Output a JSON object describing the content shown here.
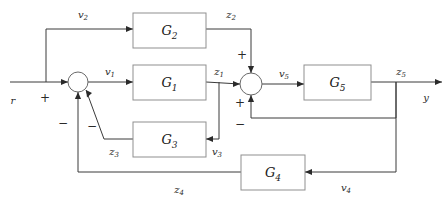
{
  "figure": {
    "type": "control-system-block-diagram",
    "title": "",
    "background_color": "#ffffff",
    "line_color": "#3a3a3a",
    "box_stroke_color": "#8f8f8f",
    "text_color": "#1a1a1a",
    "width": 447,
    "height": 205
  },
  "blocks": [
    {
      "id": "G2",
      "base": "G",
      "sub": "2",
      "x": 133,
      "y": 13,
      "w": 73,
      "h": 35
    },
    {
      "id": "G1",
      "base": "G",
      "sub": "1",
      "x": 133,
      "y": 65,
      "w": 73,
      "h": 35
    },
    {
      "id": "G3",
      "base": "G",
      "sub": "3",
      "x": 133,
      "y": 122,
      "w": 73,
      "h": 35
    },
    {
      "id": "G4",
      "base": "G",
      "sub": "4",
      "x": 241,
      "y": 155,
      "w": 64,
      "h": 35
    },
    {
      "id": "G5",
      "base": "G",
      "sub": "5",
      "x": 304,
      "y": 65,
      "w": 67,
      "h": 35
    }
  ],
  "summing_junctions": [
    {
      "id": "sum1",
      "cx": 78,
      "cy": 82,
      "r": 10,
      "signs": [
        {
          "label": "+",
          "port": "left",
          "x": 45,
          "y": 98
        },
        {
          "label": "−",
          "port": "bottom",
          "x": 63,
          "y": 123
        },
        {
          "label": "−",
          "port": "bottom-diagonal",
          "x": 92,
          "y": 126
        }
      ]
    },
    {
      "id": "sum2",
      "cx": 251,
      "cy": 84,
      "r": 11,
      "signs": [
        {
          "label": "+",
          "port": "top",
          "x": 242,
          "y": 55
        },
        {
          "label": "+",
          "port": "left",
          "x": 240,
          "y": 103
        },
        {
          "label": "−",
          "port": "bottom",
          "x": 240,
          "y": 124
        }
      ]
    }
  ],
  "signal_labels": [
    {
      "id": "r",
      "base": "r",
      "sub": "",
      "x": 13,
      "y": 101
    },
    {
      "id": "v2",
      "base": "v",
      "sub": "2",
      "x": 83,
      "y": 15
    },
    {
      "id": "z2",
      "base": "z",
      "sub": "2",
      "x": 231,
      "y": 15
    },
    {
      "id": "v1",
      "base": "v",
      "sub": "1",
      "x": 110,
      "y": 72
    },
    {
      "id": "z1",
      "base": "z",
      "sub": "1",
      "x": 219,
      "y": 72
    },
    {
      "id": "v5",
      "base": "v",
      "sub": "5",
      "x": 284,
      "y": 74
    },
    {
      "id": "z5",
      "base": "z",
      "sub": "5",
      "x": 401,
      "y": 72
    },
    {
      "id": "y",
      "base": "y",
      "sub": "",
      "x": 426,
      "y": 98
    },
    {
      "id": "z3",
      "base": "z",
      "sub": "3",
      "x": 114,
      "y": 152
    },
    {
      "id": "v3",
      "base": "v",
      "sub": "3",
      "x": 217,
      "y": 152
    },
    {
      "id": "z4",
      "base": "z",
      "sub": "4",
      "x": 179,
      "y": 190
    },
    {
      "id": "v4",
      "base": "v",
      "sub": "4",
      "x": 346,
      "y": 188
    }
  ],
  "wires": [
    {
      "id": "input-r-to-sum1",
      "d": "M 10 82 L 68 82"
    },
    {
      "id": "tap-to-G2-branch",
      "d": "M 46 82 L 46 29 L 133 29"
    },
    {
      "id": "G2-out-to-sum2",
      "d": "M 206 29 L 251 29 L 251 73"
    },
    {
      "id": "sum1-to-G1",
      "d": "M 88 82 L 133 82"
    },
    {
      "id": "G1-out-to-sum2",
      "d": "M 206 82 L 240 84"
    },
    {
      "id": "z1-tap-to-G3",
      "d": "M 219 82 L 219 139 L 206 139"
    },
    {
      "id": "G3-out-to-sum1",
      "d": "M 133 139 L 104 139 L 86 90"
    },
    {
      "id": "sum2-to-G5",
      "d": "M 262 84 L 304 84"
    },
    {
      "id": "G5-out-to-y",
      "d": "M 371 82 L 442 82"
    },
    {
      "id": "z5-tap-to-sum2-minus",
      "d": "M 396 82 L 396 118 L 251 118 L 251 95"
    },
    {
      "id": "z5-tap-to-G4",
      "d": "M 396 82 L 396 172 L 305 172"
    },
    {
      "id": "G4-out-to-sum1-minus",
      "d": "M 241 172 L 78 172 L 78 92"
    }
  ],
  "arrowheads": [
    {
      "id": "arrow-into-sum1-left",
      "x": 68,
      "y": 82,
      "dir": "right"
    },
    {
      "id": "arrow-into-G2",
      "x": 133,
      "y": 29,
      "dir": "right"
    },
    {
      "id": "arrow-into-G1",
      "x": 133,
      "y": 82,
      "dir": "right"
    },
    {
      "id": "arrow-into-sum2-left",
      "x": 240,
      "y": 84,
      "dir": "right"
    },
    {
      "id": "arrow-into-sum2-top",
      "x": 251,
      "y": 73,
      "dir": "down"
    },
    {
      "id": "arrow-into-sum2-bottom",
      "x": 251,
      "y": 95,
      "dir": "up"
    },
    {
      "id": "arrow-into-G5",
      "x": 304,
      "y": 84,
      "dir": "right"
    },
    {
      "id": "arrow-out-y",
      "x": 442,
      "y": 82,
      "dir": "right"
    },
    {
      "id": "arrow-into-G3",
      "x": 206,
      "y": 139,
      "dir": "left"
    },
    {
      "id": "arrow-into-G4",
      "x": 305,
      "y": 172,
      "dir": "left"
    },
    {
      "id": "arrow-into-sum1-bottom",
      "x": 78,
      "y": 92,
      "dir": "up"
    },
    {
      "id": "arrow-into-sum1-diag",
      "x": 86,
      "y": 90,
      "dir": "up-left"
    }
  ]
}
